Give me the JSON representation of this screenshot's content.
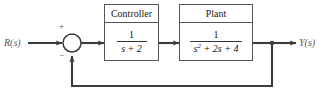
{
  "diagram": {
    "type": "control-system-block-diagram",
    "line_color": "#3c3c3c",
    "label_color": "#565656",
    "text_color": "#111111",
    "background": "#ffffff"
  },
  "signals": {
    "input_label": "R(s)",
    "output_label": "Y(s)"
  },
  "summing_junction": {
    "name": "summing-junction",
    "plus_sign": "+",
    "minus_sign": "−",
    "plus_input": "reference",
    "minus_input": "feedback"
  },
  "blocks": [
    {
      "id": "controller",
      "header": "Controller",
      "numerator": "1",
      "denominator_prefix": "s",
      "denominator_exponent": "",
      "denominator_rest": " + 2",
      "transfer_function": "1/(s + 2)"
    },
    {
      "id": "plant",
      "header": "Plant",
      "numerator": "1",
      "denominator_prefix": "s",
      "denominator_exponent": "2",
      "denominator_rest": " + 2s + 4",
      "transfer_function": "1/(s^2 + 2s + 4)"
    }
  ],
  "feedback": {
    "label": "",
    "type": "unity-feedback"
  }
}
